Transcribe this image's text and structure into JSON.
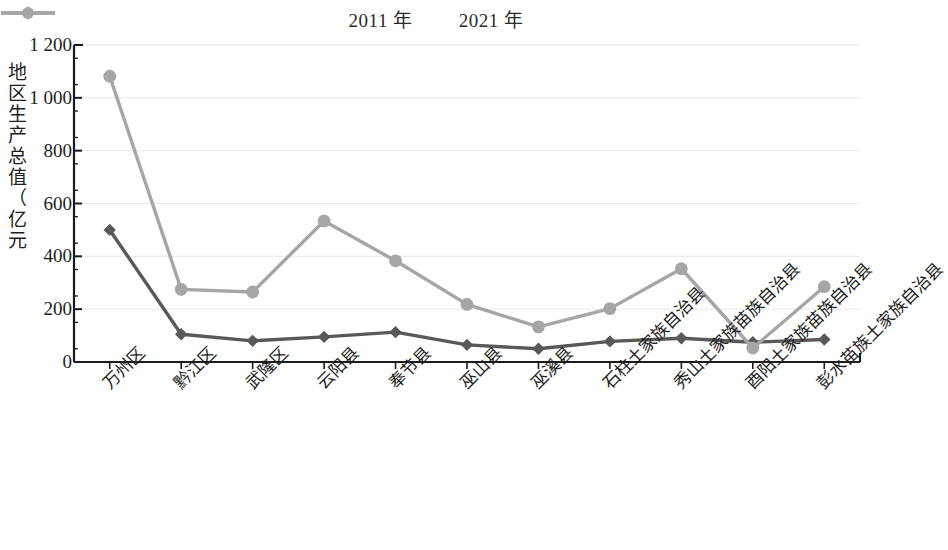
{
  "chart_data": {
    "type": "line",
    "title": "",
    "xlabel": "",
    "ylabel": "地区生产总值（亿元）",
    "ylim": [
      0,
      1200
    ],
    "yticks": [
      "0",
      "200",
      "400",
      "600",
      "800",
      "1 000",
      "1 200"
    ],
    "grid": true,
    "legend_position": "top-center",
    "categories": [
      "万州区",
      "黔江区",
      "武隆区",
      "云阳县",
      "奉节县",
      "巫山县",
      "巫溪县",
      "石柱土家族自治县",
      "秀山土家族苗族自治县",
      "酉阳土家族苗族自治县",
      "彭水苗族土家族自治县"
    ],
    "series": [
      {
        "name": "2011 年",
        "color": "#595959",
        "marker": "diamond",
        "values": [
          500,
          105,
          80,
          95,
          113,
          65,
          50,
          78,
          90,
          75,
          85
        ]
      },
      {
        "name": "2021 年",
        "color": "#a6a6a6",
        "marker": "circle",
        "values": [
          1082,
          275,
          265,
          534,
          383,
          218,
          133,
          202,
          353,
          53,
          285
        ]
      }
    ]
  },
  "axis": {
    "line_color": "#1a1a1a",
    "grid_color": "#e8e8ec"
  }
}
